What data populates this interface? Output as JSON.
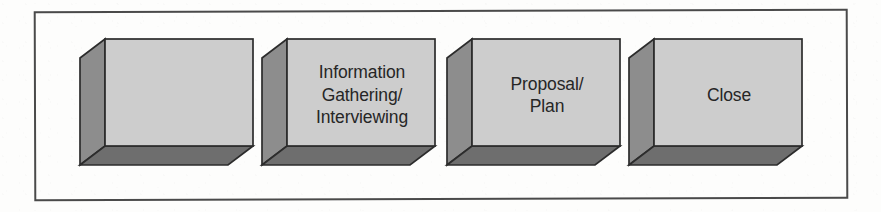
{
  "diagram": {
    "type": "process-flow",
    "title": "",
    "orientation": "horizontal",
    "frame": {
      "border_color": "#4a4a4a",
      "background_color": "#fdfdfc"
    },
    "style": {
      "front_face_color": "#cdcdcd",
      "side_face_color": "#8d8d8d",
      "bottom_face_color": "#6e6e6e",
      "outline_color": "#2c2c2c",
      "text_color": "#262626"
    },
    "steps": [
      {
        "index": 1,
        "label": "",
        "name": "step-1"
      },
      {
        "index": 2,
        "label": "Information\nGathering/\nInterviewing",
        "name": "step-2"
      },
      {
        "index": 3,
        "label": "Proposal/\nPlan",
        "name": "step-3"
      },
      {
        "index": 4,
        "label": "Close",
        "name": "step-4"
      }
    ]
  }
}
